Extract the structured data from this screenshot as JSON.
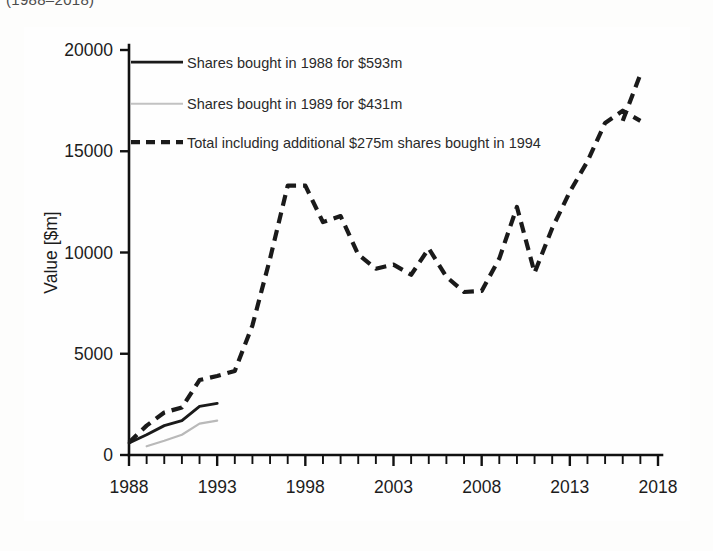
{
  "caption_fragment": "(1988–2018)",
  "figure": {
    "border_color": "#2b2b2b",
    "background": "#fefefe"
  },
  "axes": {
    "y_label": "Value [$m]",
    "y_ticks": [
      "0",
      "5000",
      "10000",
      "15000",
      "20000"
    ],
    "x_ticks": [
      "1988",
      "1993",
      "1998",
      "2003",
      "2008",
      "2013",
      "2018"
    ]
  },
  "legend": {
    "items": [
      {
        "label": "Shares bought in 1988 for $593m",
        "style": "solid-black",
        "color": "#1a1a1a"
      },
      {
        "label": "Shares bought in 1989 for $431m",
        "style": "solid-gray",
        "color": "#c2c2c2"
      },
      {
        "label": "Total including additional $275m shares bought in 1994",
        "style": "dashed-black",
        "color": "#1a1a1a"
      }
    ]
  },
  "chart_data": {
    "type": "line",
    "title": "",
    "xlabel": "",
    "ylabel": "Value [$m]",
    "xlim": [
      1988,
      2018
    ],
    "ylim": [
      0,
      20000
    ],
    "yticks": [
      0,
      5000,
      10000,
      15000,
      20000
    ],
    "xticks": [
      1988,
      1993,
      1998,
      2003,
      2008,
      2013,
      2018
    ],
    "x_minor_tick_step": 1,
    "grid": false,
    "legend_position": "top-left",
    "series": [
      {
        "name": "Shares bought in 1988 for $593m",
        "style": "solid",
        "color": "#1a1a1a",
        "x": [
          1988,
          1989,
          1990,
          1991,
          1992,
          1993
        ],
        "values": [
          593,
          1000,
          1450,
          1700,
          2400,
          2550
        ]
      },
      {
        "name": "Shares bought in 1989 for $431m",
        "style": "solid",
        "color": "#c2c2c2",
        "x": [
          1989,
          1990,
          1991,
          1992,
          1993
        ],
        "values": [
          431,
          700,
          1000,
          1550,
          1700
        ]
      },
      {
        "name": "Total including additional $275m shares bought in 1994",
        "style": "dashed",
        "color": "#1a1a1a",
        "x": [
          1988,
          1989,
          1990,
          1991,
          1992,
          1993,
          1994,
          1995,
          1996,
          1997,
          1998,
          1999,
          2000,
          2001,
          2002,
          2003,
          2004,
          2005,
          2006,
          2007,
          2008,
          2009,
          2010,
          2011,
          2012,
          2013,
          2014,
          2015,
          2016,
          2017
        ],
        "values": [
          620,
          1450,
          2100,
          2350,
          3700,
          3900,
          4150,
          6400,
          9700,
          13300,
          13300,
          11500,
          11800,
          9900,
          9200,
          9400,
          8900,
          10200,
          8800,
          8050,
          8100,
          9700,
          12250,
          9000,
          11200,
          13000,
          14500,
          16400,
          17000,
          16500
        ]
      }
    ],
    "series_tail": {
      "name": "Total including additional $275m shares bought in 1994",
      "x": [
        2016,
        2017
      ],
      "values": [
        16500,
        18800
      ]
    }
  }
}
